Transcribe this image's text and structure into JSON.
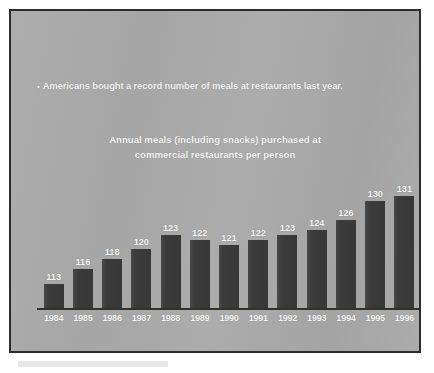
{
  "slide": {
    "bullet_dot": "•",
    "bullet_text": "Americans bought a record number of meals at restaurants last year.",
    "panel_color": "#a9a9a9",
    "border_color": "#2c2c2c",
    "text_color": "#f4f4f4",
    "bar_color": "#3b3b3b"
  },
  "chart_data": {
    "type": "bar",
    "title": "Annual meals (including snacks) purchased at commercial restaurants per person",
    "title_line1": "Annual meals (including snacks) purchased at",
    "title_line2": "commercial restaurants per person",
    "subtitle": "",
    "xlabel": "",
    "ylabel": "",
    "categories": [
      "1984",
      "1985",
      "1986",
      "1987",
      "1988",
      "1989",
      "1990",
      "1991",
      "1992",
      "1993",
      "1994",
      "1995",
      "1996"
    ],
    "values": [
      113,
      116,
      118,
      120,
      123,
      122,
      121,
      122,
      123,
      124,
      126,
      130,
      131
    ],
    "value_labels": [
      "113",
      "116",
      "118",
      "120",
      "123",
      "122",
      "121",
      "122",
      "123",
      "124",
      "126",
      "130",
      "131"
    ],
    "ylim": [
      108,
      133
    ],
    "grid": false,
    "legend": null,
    "axis_baseline_visible": true,
    "series": [
      {
        "name": "Annual meals per person",
        "values": [
          113,
          116,
          118,
          120,
          123,
          122,
          121,
          122,
          123,
          124,
          126,
          130,
          131
        ]
      }
    ]
  }
}
